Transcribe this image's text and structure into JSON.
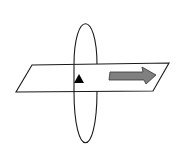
{
  "diagram": {
    "colors": {
      "background": "#ffffff",
      "stroke": "#1a1a1a",
      "plane_fill": "#ffffff",
      "block_arrow_fill": "#808080",
      "arrowhead_fill": "#000000"
    },
    "plane": {
      "points": "32,65 169,63 153,91 16,92"
    },
    "loop": {
      "cx": 85.5,
      "cy": 80.5,
      "rx": 11.5,
      "ry": 63.5
    },
    "arrowhead": {
      "points": "74,83 79,74 84,83",
      "direction": "up"
    },
    "block_arrow": {
      "points": "110,72 143,72 142,67 156,75 146,84 144,80 109,80",
      "direction": "right"
    }
  }
}
